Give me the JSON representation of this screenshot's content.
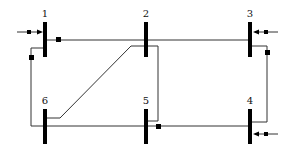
{
  "diagram": {
    "type": "power-system-single-line",
    "colors": {
      "line": "#333333",
      "bus": "#000000",
      "background": "#ffffff"
    },
    "buses": [
      {
        "id": "1",
        "label": "1"
      },
      {
        "id": "2",
        "label": "2"
      },
      {
        "id": "3",
        "label": "3"
      },
      {
        "id": "4",
        "label": "4"
      },
      {
        "id": "5",
        "label": "5"
      },
      {
        "id": "6",
        "label": "6"
      }
    ],
    "connections": [
      {
        "from": "1",
        "to": "2"
      },
      {
        "from": "2",
        "to": "3"
      },
      {
        "from": "1",
        "to": "6"
      },
      {
        "from": "3",
        "to": "4"
      },
      {
        "from": "2",
        "to": "6"
      },
      {
        "from": "2",
        "to": "5"
      },
      {
        "from": "6",
        "to": "5"
      },
      {
        "from": "5",
        "to": "4"
      }
    ],
    "injections": [
      {
        "bus": "1",
        "direction": "in-from-left"
      },
      {
        "bus": "3",
        "direction": "in-from-right"
      },
      {
        "bus": "4",
        "direction": "in-from-right"
      }
    ]
  }
}
